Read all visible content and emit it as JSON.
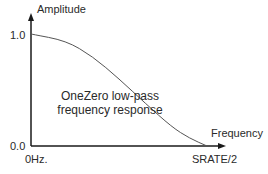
{
  "chart_data": {
    "type": "line",
    "title": "OneZero low-pass frequency response",
    "xlabel": "Frequency",
    "ylabel": "Amplitude",
    "x_ticks": [
      "0Hz.",
      "SRATE/2"
    ],
    "y_ticks": [
      "1.0",
      "0.0"
    ],
    "xlim": [
      0,
      1
    ],
    "ylim": [
      0,
      1
    ],
    "grid": false,
    "legend": null,
    "series": [
      {
        "name": "OneZero low-pass response",
        "x": [
          0.0,
          0.2,
          0.35,
          0.5,
          0.65,
          0.8,
          0.9,
          1.0
        ],
        "y": [
          1.0,
          0.94,
          0.8,
          0.6,
          0.38,
          0.17,
          0.07,
          0.0
        ]
      }
    ]
  },
  "labels": {
    "y_axis": "Amplitude",
    "x_axis": "Frequency",
    "y_max": "1.0",
    "y_min": "0.0",
    "x_min": "0Hz.",
    "x_max": "SRATE/2",
    "caption_line1": "OneZero low-pass",
    "caption_line2": "frequency response"
  },
  "colors": {
    "axis": "#1a1a1a",
    "curve": "#555555",
    "text": "#2a2a2a"
  }
}
